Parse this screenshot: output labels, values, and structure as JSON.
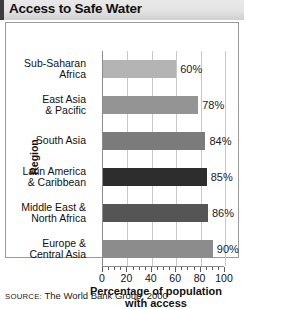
{
  "title": "Access to Safe Water",
  "source": {
    "label": "SOURCE:",
    "text": "The World Bank Group, 2000"
  },
  "chart_data": {
    "type": "bar",
    "orientation": "horizontal",
    "title": "Access to Safe Water",
    "xlabel": "Percentage of population with access",
    "ylabel": "Region",
    "xlim": [
      0,
      100
    ],
    "xticks": [
      0,
      20,
      40,
      60,
      80,
      100
    ],
    "xtick_labels": [
      "0",
      "20",
      "40",
      "60",
      "80",
      "100"
    ],
    "minor_tick_step": 5,
    "grid": true,
    "grid_axis": "x",
    "legend": "none",
    "value_suffix": "%",
    "categories": [
      "Sub-Saharan Africa",
      "East Asia & Pacific",
      "South Asia",
      "Latin America & Caribbean",
      "Middle East & North Africa",
      "Europe & Central Asia"
    ],
    "values": [
      60,
      78,
      84,
      85,
      86,
      90
    ],
    "value_labels": [
      "60%",
      "78%",
      "84%",
      "85%",
      "86%",
      "90%"
    ],
    "bar_colors": [
      "#b4b4b4",
      "#949494",
      "#7b7b7b",
      "#2d2d2d",
      "#555555",
      "#8c8c8c"
    ],
    "bars": [
      {
        "category_line1": "Sub-Saharan",
        "category_line2": "Africa",
        "value": 60,
        "value_label": "60%",
        "color": "#b4b4b4"
      },
      {
        "category_line1": "East Asia",
        "category_line2": "& Pacific",
        "value": 78,
        "value_label": "78%",
        "color": "#949494"
      },
      {
        "category_line1": "South Asia",
        "category_line2": "",
        "value": 84,
        "value_label": "84%",
        "color": "#7b7b7b"
      },
      {
        "category_line1": "Latin America",
        "category_line2": "& Caribbean",
        "value": 85,
        "value_label": "85%",
        "color": "#2d2d2d"
      },
      {
        "category_line1": "Middle East &",
        "category_line2": "North Africa",
        "value": 86,
        "value_label": "86%",
        "color": "#555555"
      },
      {
        "category_line1": "Europe &",
        "category_line2": "Central Asia",
        "value": 90,
        "value_label": "90%",
        "color": "#8c8c8c"
      }
    ]
  },
  "axis": {
    "x_title_line1": "Percentage of population",
    "x_title_line2": "with access",
    "y_title": "Region"
  },
  "colors": {
    "title_band_start": "#e9e9e9",
    "title_band_end": "#cfcfcf",
    "title_accent": "#3c3c3c",
    "frame_border": "#9a9a9a",
    "gridline": "#c8c8c8",
    "axis_line": "#8c8c8c",
    "text": "#111111"
  }
}
